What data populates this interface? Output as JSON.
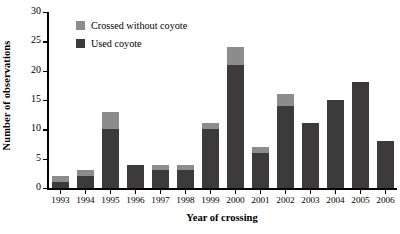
{
  "chart_data": {
    "type": "bar",
    "stacked": true,
    "title": "",
    "xlabel": "Year of crossing",
    "ylabel": "Number of observations",
    "categories": [
      "1993",
      "1994",
      "1995",
      "1996",
      "1997",
      "1998",
      "1999",
      "2000",
      "2001",
      "2002",
      "2003",
      "2004",
      "2005",
      "2006"
    ],
    "series": [
      {
        "name": "Used coyote",
        "color": "#3c3a3b",
        "values": [
          1,
          2,
          10,
          4,
          3,
          3,
          10,
          21,
          6,
          14,
          11,
          15,
          18,
          8
        ]
      },
      {
        "name": "Crossed without coyote",
        "color": "#8d8c8d",
        "values": [
          1,
          1,
          3,
          0,
          1,
          1,
          1,
          3,
          1,
          2,
          0,
          0,
          0,
          0
        ]
      }
    ],
    "totals": [
      2,
      3,
      13,
      4,
      4,
      4,
      11,
      24,
      7,
      16,
      11,
      15,
      18,
      8
    ],
    "ylim": [
      0,
      30
    ],
    "yticks": [
      0,
      5,
      10,
      15,
      20,
      25,
      30
    ],
    "ytick_labels": [
      "0",
      "5",
      "10",
      "15",
      "20",
      "25",
      "30"
    ],
    "grid": false,
    "legend_position": "top-left-inside",
    "legend_entries": [
      "Crossed without coyote",
      "Used coyote"
    ]
  },
  "axes": {
    "y_title": "Number of observations",
    "x_title": "Year of crossing"
  },
  "legend": {
    "entries": [
      {
        "label": "Crossed without coyote",
        "color": "#8d8c8d"
      },
      {
        "label": "Used coyote",
        "color": "#3c3a3b"
      }
    ]
  }
}
